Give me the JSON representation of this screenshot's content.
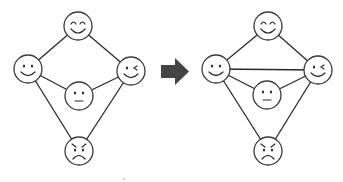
{
  "diagram": {
    "colors": {
      "background": "#ffffff",
      "stroke": "#2a2a2a",
      "arrow": "#444444"
    },
    "node_radius": 14,
    "arrow": {
      "icon": "right-arrow-icon",
      "direction": "right",
      "shaft": {
        "x1": 161,
        "x2": 175,
        "y1": 65,
        "y2": 78
      },
      "head": {
        "x1": 175,
        "x2": 189,
        "y_top": 58,
        "y_bottom": 85
      }
    },
    "graphs": [
      {
        "name": "before",
        "nodes": [
          {
            "id": "happy",
            "face": "happy-face-icon",
            "cx": 78,
            "cy": 26
          },
          {
            "id": "smile",
            "face": "smile-face-icon",
            "cx": 28,
            "cy": 69
          },
          {
            "id": "wink",
            "face": "wink-face-icon",
            "cx": 131,
            "cy": 71
          },
          {
            "id": "neutral",
            "face": "neutral-face-icon",
            "cx": 79,
            "cy": 96
          },
          {
            "id": "angry",
            "face": "angry-face-icon",
            "cx": 79,
            "cy": 151
          }
        ],
        "edges": [
          [
            "happy",
            "smile"
          ],
          [
            "happy",
            "wink"
          ],
          [
            "smile",
            "neutral"
          ],
          [
            "neutral",
            "wink"
          ],
          [
            "smile",
            "angry"
          ],
          [
            "wink",
            "angry"
          ]
        ]
      },
      {
        "name": "after",
        "nodes": [
          {
            "id": "happy",
            "face": "happy-face-icon",
            "cx": 268,
            "cy": 26
          },
          {
            "id": "smile",
            "face": "smile-face-icon",
            "cx": 216,
            "cy": 69
          },
          {
            "id": "wink",
            "face": "wink-face-icon",
            "cx": 318,
            "cy": 70
          },
          {
            "id": "neutral",
            "face": "neutral-face-icon",
            "cx": 267,
            "cy": 95
          },
          {
            "id": "angry",
            "face": "angry-face-icon",
            "cx": 268,
            "cy": 151
          }
        ],
        "edges": [
          [
            "happy",
            "smile"
          ],
          [
            "happy",
            "wink"
          ],
          [
            "smile",
            "wink"
          ],
          [
            "smile",
            "neutral"
          ],
          [
            "neutral",
            "wink"
          ],
          [
            "smile",
            "angry"
          ],
          [
            "wink",
            "angry"
          ]
        ]
      }
    ]
  }
}
